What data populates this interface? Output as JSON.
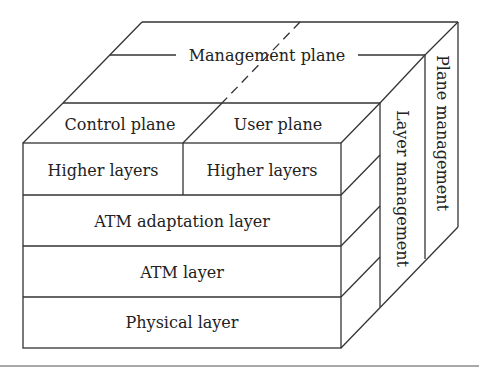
{
  "diagram": {
    "planes": {
      "management": "Management plane",
      "control": "Control plane",
      "user": "User plane"
    },
    "layers": {
      "higher_control": "Higher layers",
      "higher_user": "Higher layers",
      "aal": "ATM adaptation layer",
      "atm": "ATM layer",
      "physical": "Physical layer"
    },
    "side_strips": {
      "layer_management": "Layer management",
      "plane_management": "Plane management"
    },
    "colors": {
      "line": "#333333",
      "text": "#222222",
      "background": "#ffffff"
    }
  }
}
